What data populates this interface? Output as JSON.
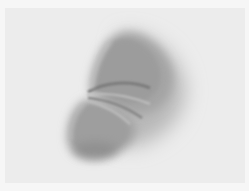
{
  "image": {
    "subject": "gathered-fabric-fold",
    "tone": "grayscale",
    "colors": {
      "background": "#ececec",
      "border": "#f6f6f6",
      "fabric_light": "#b4b4b4",
      "fabric_mid": "#9a9a9a",
      "fabric_dark": "#7a7a7a"
    }
  }
}
